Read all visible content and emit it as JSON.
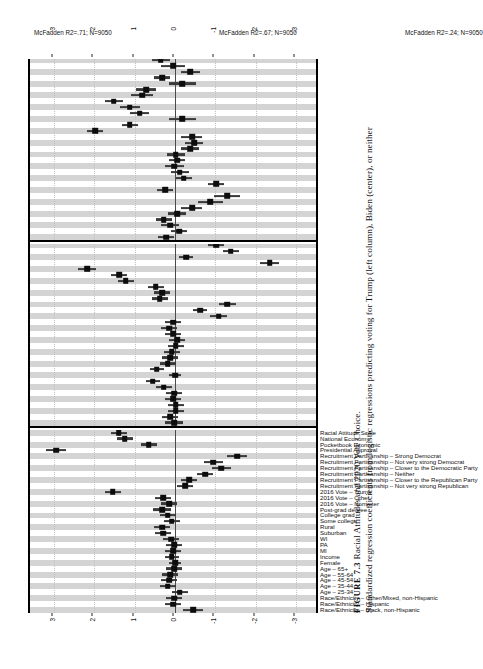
{
  "figure": {
    "number_label": "FIGURE 7.3",
    "title": "Racial Attitudes and 2020 Vote Choice.",
    "caption": "Standardized regression coefficients from logistic regressions predicting voting for Trump (left column), Biden (center), or neither"
  },
  "axis": {
    "ticks": [
      -3,
      -2,
      -1,
      0,
      1,
      2,
      3
    ],
    "tick_labels": [
      "-3",
      "-2",
      "-1",
      "0",
      "1",
      "2",
      "3"
    ],
    "limits": [
      -3.6,
      3.6
    ],
    "zero_reference": 0
  },
  "colors": {
    "band": "#d4d4d4",
    "point": "#0d0d0d",
    "ci": "#3a3a3a",
    "zero_line": "#4a4a4a",
    "frame": "#000000",
    "background": "#ffffff"
  },
  "variables": [
    "Race/Ethnicity – Black, non-Hispanic",
    "Race/Ethnicity – Hispanic",
    "Race/Ethnicity – Other/Mixed, non-Hispanic",
    "Age – 25-34",
    "Age – 35-44",
    "Age – 45-54",
    "Age – 55-64",
    "Age – 65+",
    "Female",
    "Income",
    "MI",
    "PA",
    "WI",
    "Suburban",
    "Rural",
    "Some college",
    "College grad",
    "Post-grad degree",
    "2016 Vote – Nonvoter",
    "2016 Vote – Other",
    "2016 Vote – Trump",
    "Recruitment Partisanship – Not very strong Republican",
    "Recruitment Partisanship – Closer to the Republican Party",
    "Recruitment Partisanship – Neither",
    "Recruitment Partisanship – Closer to the Democratic Party",
    "Recruitment Partisanship – Not very strong Democrat",
    "Recruitment Partisanship – Strong Democrat",
    "Presidential Approval",
    "Pocketbook Economic",
    "National Economy",
    "Racial Attitude Scale"
  ],
  "panels": [
    {
      "id": "trump",
      "note": "McFadden R2=.71; N=9050",
      "mcfadden_r2": 0.71,
      "n": 9050
    },
    {
      "id": "biden",
      "note": "McFadden R2=.67; N=9050",
      "mcfadden_r2": 0.67,
      "n": 9050
    },
    {
      "id": "neither",
      "note": "McFadden R2=.24; N=9050",
      "mcfadden_r2": 0.24,
      "n": 9050
    }
  ],
  "chart_data": {
    "type": "scatter",
    "title": "Racial Attitudes and 2020 Vote Choice.",
    "xlabel": "",
    "ylabel": "Standardized regression coefficient",
    "ylim": [
      -3.6,
      3.6
    ],
    "grid": true,
    "legend": "none",
    "orientation": "vertical-coefficient-panels",
    "categories": [
      "Race/Ethnicity – Black, non-Hispanic",
      "Race/Ethnicity – Hispanic",
      "Race/Ethnicity – Other/Mixed, non-Hispanic",
      "Age – 25-34",
      "Age – 35-44",
      "Age – 45-54",
      "Age – 55-64",
      "Age – 65+",
      "Female",
      "Income",
      "MI",
      "PA",
      "WI",
      "Suburban",
      "Rural",
      "Some college",
      "College grad",
      "Post-grad degree",
      "2016 Vote – Nonvoter",
      "2016 Vote – Other",
      "2016 Vote – Trump",
      "Recruitment Partisanship – Not very strong Republican",
      "Recruitment Partisanship – Closer to the Republican Party",
      "Recruitment Partisanship – Neither",
      "Recruitment Partisanship – Closer to the Democratic Party",
      "Recruitment Partisanship – Not very strong Democrat",
      "Recruitment Partisanship – Strong Democrat",
      "Presidential Approval",
      "Pocketbook Economic",
      "National Economy",
      "Racial Attitude Scale"
    ],
    "series": [
      {
        "name": "Trump (left column)",
        "panel": "trump",
        "note": "McFadden R2=.71; N=9050",
        "estimates": [
          -0.45,
          0.05,
          0.02,
          -0.12,
          0.18,
          0.15,
          0.12,
          0.02,
          0.0,
          0.08,
          0.05,
          0.02,
          0.1,
          0.3,
          0.32,
          0.08,
          0.18,
          0.32,
          0.15,
          0.3,
          1.55,
          -0.25,
          -0.35,
          -0.75,
          -1.15,
          -0.95,
          -1.55,
          2.95,
          0.65,
          1.25,
          1.4
        ],
        "ci_low": [
          -0.7,
          -0.15,
          -0.18,
          -0.32,
          -0.02,
          -0.05,
          -0.08,
          -0.18,
          -0.16,
          -0.1,
          -0.16,
          -0.18,
          -0.1,
          0.1,
          0.12,
          -0.12,
          -0.02,
          0.1,
          -0.05,
          0.1,
          1.35,
          -0.45,
          -0.55,
          -0.95,
          -1.38,
          -1.18,
          -1.8,
          2.7,
          0.45,
          1.05,
          1.2
        ],
        "ci_high": [
          -0.2,
          0.25,
          0.22,
          0.08,
          0.38,
          0.35,
          0.32,
          0.22,
          0.16,
          0.26,
          0.26,
          0.22,
          0.3,
          0.5,
          0.52,
          0.28,
          0.38,
          0.54,
          0.35,
          0.5,
          1.75,
          -0.05,
          -0.15,
          -0.55,
          -0.92,
          -0.72,
          -1.3,
          3.2,
          0.85,
          1.45,
          1.6
        ]
      },
      {
        "name": "Biden (center)",
        "panel": "biden",
        "note": "McFadden R2=.67; N=9050",
        "estimates": [
          0.02,
          0.12,
          -0.02,
          -0.02,
          0.05,
          0.02,
          0.28,
          0.55,
          0.0,
          0.45,
          0.18,
          0.12,
          0.08,
          -0.02,
          -0.05,
          0.05,
          0.15,
          0.05,
          -1.08,
          -0.62,
          -1.3,
          0.38,
          0.32,
          0.48,
          1.22,
          1.38,
          2.18,
          -2.35,
          -0.28,
          -1.38,
          -1.02
        ],
        "ci_low": [
          -0.2,
          -0.08,
          -0.22,
          -0.22,
          -0.15,
          -0.18,
          0.08,
          0.38,
          -0.16,
          0.28,
          -0.02,
          -0.08,
          -0.12,
          -0.22,
          -0.25,
          -0.15,
          -0.05,
          -0.15,
          -1.28,
          -0.8,
          -1.52,
          0.18,
          0.12,
          0.28,
          1.02,
          1.18,
          1.95,
          -2.58,
          -0.45,
          -1.58,
          -1.22
        ],
        "ci_high": [
          0.24,
          0.32,
          0.18,
          0.18,
          0.25,
          0.22,
          0.48,
          0.72,
          0.16,
          0.62,
          0.38,
          0.32,
          0.28,
          0.18,
          0.15,
          0.25,
          0.35,
          0.25,
          -0.88,
          -0.44,
          -1.08,
          0.58,
          0.52,
          0.68,
          1.42,
          1.58,
          2.42,
          -2.12,
          -0.11,
          -1.18,
          -0.82
        ]
      },
      {
        "name": "Neither",
        "panel": "neither",
        "note": "McFadden R2=.24; N=9050",
        "estimates": [
          0.22,
          -0.1,
          0.12,
          0.28,
          -0.05,
          -0.42,
          -0.88,
          -1.3,
          0.25,
          -1.02,
          -0.22,
          -0.12,
          0.02,
          -0.05,
          -0.02,
          -0.38,
          -0.48,
          -0.42,
          1.98,
          1.12,
          -0.18,
          0.88,
          1.12,
          1.52,
          0.82,
          0.72,
          -0.18,
          0.32,
          -0.38,
          0.05,
          0.35
        ],
        "ci_low": [
          0.02,
          -0.3,
          -0.1,
          0.08,
          -0.28,
          -0.68,
          -1.18,
          -1.62,
          0.05,
          -1.22,
          -0.42,
          -0.35,
          -0.22,
          -0.25,
          -0.25,
          -0.6,
          -0.7,
          -0.68,
          1.78,
          0.92,
          -0.52,
          0.65,
          0.88,
          1.3,
          0.55,
          0.48,
          -0.52,
          0.12,
          -0.62,
          -0.25,
          0.12
        ],
        "ci_high": [
          0.42,
          0.1,
          0.34,
          0.48,
          0.18,
          -0.16,
          -0.58,
          -0.98,
          0.45,
          -0.82,
          -0.02,
          0.11,
          0.26,
          0.15,
          0.2,
          -0.16,
          -0.26,
          -0.16,
          2.18,
          1.32,
          0.16,
          1.11,
          1.36,
          1.74,
          1.09,
          0.96,
          0.16,
          0.52,
          -0.14,
          0.35,
          0.58
        ]
      }
    ]
  }
}
